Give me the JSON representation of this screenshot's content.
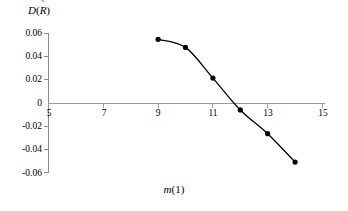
{
  "chart_data": {
    "type": "line",
    "title": "",
    "xlabel": "m(1)",
    "xlabel_italic_part": "m",
    "xlabel_paren_part": "(1)",
    "ylabel": "D(R̃)",
    "ylabel_d": "D",
    "ylabel_r": "R",
    "ylabel_tilde": "˜",
    "ylabel_open_paren": "(",
    "ylabel_close_paren": ")",
    "x": [
      9,
      10,
      11,
      12,
      13,
      14
    ],
    "values": [
      0.055,
      0.048,
      0.0215,
      -0.006,
      -0.0265,
      -0.051
    ],
    "xlim": [
      5,
      15
    ],
    "ylim": [
      -0.06,
      0.06
    ],
    "xticks": [
      "5",
      "7",
      "9",
      "11",
      "13",
      "15"
    ],
    "xtick_values": [
      5,
      7,
      9,
      11,
      13,
      15
    ],
    "yticks": [
      "0.06",
      "0.04",
      "0.02",
      "0",
      "-0.02",
      "-0.04",
      "-0.06"
    ],
    "ytick_values": [
      0.06,
      0.04,
      0.02,
      0,
      -0.02,
      -0.04,
      -0.06
    ],
    "grid": false,
    "legend": null,
    "marker": "filled-circle",
    "line_color": "#000000",
    "marker_color": "#000000",
    "axis_color": "#808080",
    "smoothing": "spline"
  }
}
